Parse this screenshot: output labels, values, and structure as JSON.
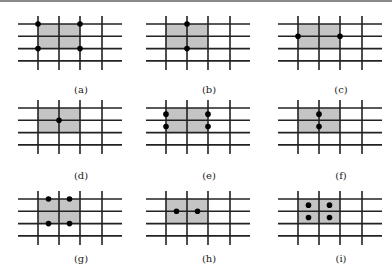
{
  "figure": {
    "panels": [
      {
        "id": "a",
        "label": "(a)",
        "dots": [
          [
            0,
            0
          ],
          [
            2,
            0
          ],
          [
            0,
            2
          ],
          [
            2,
            2
          ]
        ]
      },
      {
        "id": "b",
        "label": "(b)",
        "dots": [
          [
            1,
            0
          ],
          [
            1,
            2
          ]
        ]
      },
      {
        "id": "c",
        "label": "(c)",
        "dots": [
          [
            0,
            1
          ],
          [
            2,
            1
          ]
        ]
      },
      {
        "id": "d",
        "label": "(d)",
        "dots": [
          [
            1,
            1
          ]
        ]
      },
      {
        "id": "e",
        "label": "(e)",
        "dots": [
          [
            0,
            0.5
          ],
          [
            0,
            1.5
          ],
          [
            2,
            0.5
          ],
          [
            2,
            1.5
          ]
        ]
      },
      {
        "id": "f",
        "label": "(f)",
        "dots": [
          [
            1,
            0.5
          ],
          [
            1,
            1.5
          ]
        ]
      },
      {
        "id": "g",
        "label": "(g)",
        "dots": [
          [
            0.5,
            0
          ],
          [
            1.5,
            0
          ],
          [
            0.5,
            2
          ],
          [
            1.5,
            2
          ]
        ]
      },
      {
        "id": "h",
        "label": "(h)",
        "dots": [
          [
            0.5,
            1
          ],
          [
            1.5,
            1
          ]
        ]
      },
      {
        "id": "i",
        "label": "(i)",
        "dots": [
          [
            0.5,
            0.5
          ],
          [
            1.5,
            0.5
          ],
          [
            0.5,
            1.5
          ],
          [
            1.5,
            1.5
          ]
        ]
      }
    ],
    "grid": {
      "rows": 4,
      "cols": 4,
      "shaded_cells": "2x2 block at top-left (columns 1-2, rows 1-2)"
    },
    "colors": {
      "shade": "#c4c4c4",
      "lines": "#222222",
      "dots": "#000000"
    }
  }
}
